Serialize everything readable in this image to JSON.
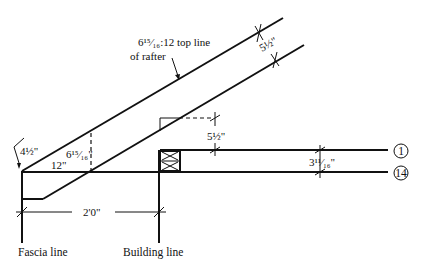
{
  "diagram": {
    "labels": {
      "pitch_note_line1": "6¹⁵⁄₁₆:12 top line",
      "pitch_note_line2": "of rafter",
      "rafter_depth": "5½\"",
      "plumb_height": "6¹⁵⁄₁₆\"",
      "run": "12\"",
      "heel_cut": "4½\"",
      "plate_rise": "5½\"",
      "line_offset": "3¹¹⁄₁₆\"",
      "overhang": "2'0\"",
      "fascia_line": "Fascia line",
      "building_line": "Building line",
      "marker_1": "1",
      "marker_14": "14"
    }
  }
}
